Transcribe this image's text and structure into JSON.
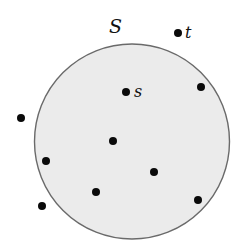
{
  "diagram": {
    "title": "",
    "set": {
      "label": "S",
      "shape": "circle",
      "cx": 132,
      "cy": 141.5,
      "r": 97.5,
      "fill": "#ebebeb",
      "stroke": "#6a6a6a",
      "label_x": 109,
      "label_y": 33
    },
    "points": [
      {
        "id": "t",
        "label": "t",
        "x": 178,
        "y": 33,
        "inside": false,
        "label_x": 185,
        "label_y": 38
      },
      {
        "id": "s",
        "label": "s",
        "x": 126,
        "y": 92,
        "inside": true,
        "label_x": 134,
        "label_y": 97
      },
      {
        "id": "p1",
        "label": "",
        "x": 201,
        "y": 87,
        "inside": true
      },
      {
        "id": "p2",
        "label": "",
        "x": 21,
        "y": 118,
        "inside": false
      },
      {
        "id": "p3",
        "label": "",
        "x": 113,
        "y": 141,
        "inside": true
      },
      {
        "id": "p4",
        "label": "",
        "x": 46,
        "y": 161,
        "inside": true
      },
      {
        "id": "p5",
        "label": "",
        "x": 154,
        "y": 172,
        "inside": true
      },
      {
        "id": "p6",
        "label": "",
        "x": 96,
        "y": 192,
        "inside": true
      },
      {
        "id": "p7",
        "label": "",
        "x": 42,
        "y": 206,
        "inside": false
      },
      {
        "id": "p8",
        "label": "",
        "x": 198,
        "y": 200,
        "inside": true
      }
    ],
    "point_radius": 4,
    "point_color": "#0a0a0a"
  }
}
